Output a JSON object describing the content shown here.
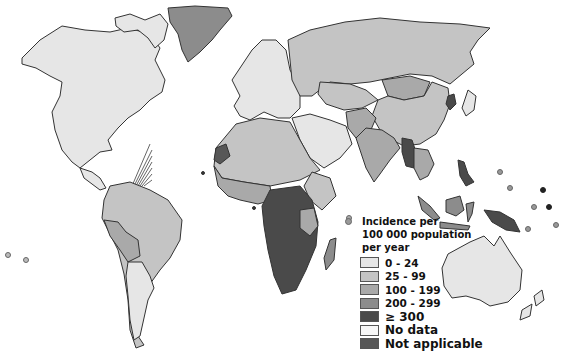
{
  "map": {
    "title": "Incidence per 100 000 population per year",
    "colors": {
      "bin_0_24": "#e6e6e6",
      "bin_25_99": "#c4c4c4",
      "bin_100_199": "#a9a9a9",
      "bin_200_299": "#8c8c8c",
      "bin_300_plus": "#4a4a4a",
      "no_data": "#f7f7f7",
      "not_applicable": "#575757"
    },
    "regions": [
      {
        "name": "North America",
        "bin": "0-24"
      },
      {
        "name": "Greenland",
        "bin": "200-299"
      },
      {
        "name": "Europe",
        "bin": "0-24"
      },
      {
        "name": "Russia",
        "bin": "25-99"
      },
      {
        "name": "China",
        "bin": "25-99"
      },
      {
        "name": "Mongolia",
        "bin": "100-199"
      },
      {
        "name": "India",
        "bin": "100-199"
      },
      {
        "name": "Myanmar",
        "bin": "≥ 300"
      },
      {
        "name": "North Korea",
        "bin": "≥ 300"
      },
      {
        "name": "Indonesia",
        "bin": "200-299"
      },
      {
        "name": "Papua New Guinea",
        "bin": "≥ 300"
      },
      {
        "name": "Philippines",
        "bin": "≥ 300"
      },
      {
        "name": "North Africa",
        "bin": "25-99"
      },
      {
        "name": "West Africa",
        "bin": "100-199"
      },
      {
        "name": "Central & Southern Africa",
        "bin": "≥ 300"
      },
      {
        "name": "Madagascar",
        "bin": "200-299"
      },
      {
        "name": "South America",
        "bin": "25-99"
      },
      {
        "name": "Bolivia/Peru",
        "bin": "100-199"
      },
      {
        "name": "Argentina/Chile",
        "bin": "0-24"
      },
      {
        "name": "Australia",
        "bin": "0-24"
      },
      {
        "name": "Western Sahara",
        "bin": "Not applicable"
      }
    ]
  },
  "legend": {
    "title_line1": "Incidence per",
    "title_line2": "100 000 population",
    "title_line3": "per year",
    "items": [
      {
        "label": "0 - 24",
        "color": "#e6e6e6"
      },
      {
        "label": "25 - 99",
        "color": "#c4c4c4"
      },
      {
        "label": "100 - 199",
        "color": "#a9a9a9"
      },
      {
        "label": "200 - 299",
        "color": "#8c8c8c"
      },
      {
        "label": "≥ 300",
        "color": "#4a4a4a"
      },
      {
        "label": "No data",
        "color": "#f7f7f7"
      },
      {
        "label": "Not applicable",
        "color": "#575757"
      }
    ]
  }
}
